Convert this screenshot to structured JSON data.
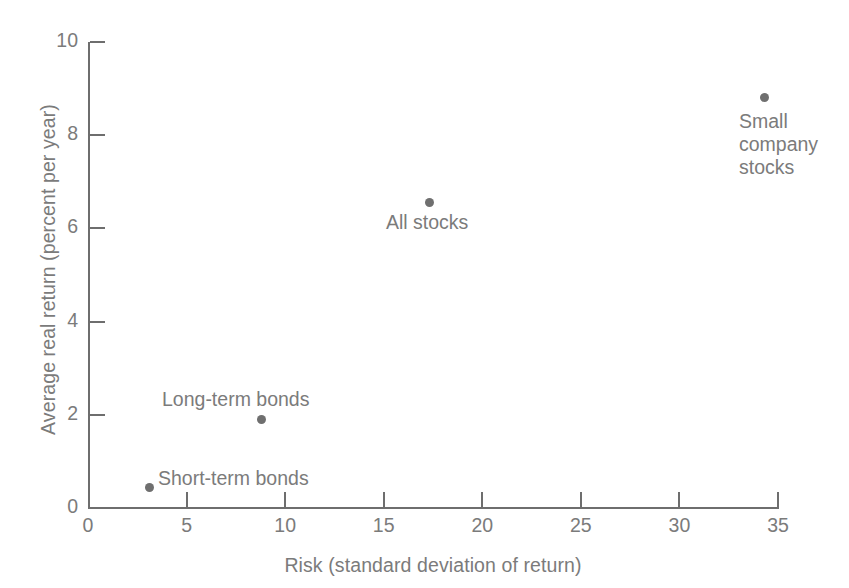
{
  "chart_data": {
    "type": "scatter",
    "title": "",
    "xlabel": "Risk (standard deviation of return)",
    "ylabel": "Average real return (percent per year)",
    "xlim": [
      0,
      35
    ],
    "ylim": [
      0,
      10
    ],
    "xticks": [
      "0",
      "5",
      "10",
      "15",
      "20",
      "25",
      "30",
      "35"
    ],
    "yticks": [
      "0",
      "2",
      "4",
      "6",
      "8",
      "10"
    ],
    "xtick_values": [
      0,
      5,
      10,
      15,
      20,
      25,
      30,
      35
    ],
    "ytick_values": [
      0,
      2,
      4,
      6,
      8,
      10
    ],
    "grid": false,
    "legend": "none",
    "marker_color": "#6f6f6f",
    "axis_color": "#6e6e6e",
    "text_color": "#7b7b7b",
    "background": "#ffffff",
    "points": [
      {
        "label": "Short-term bonds",
        "x": 3.1,
        "y": 0.45
      },
      {
        "label": "Long-term bonds",
        "x": 8.8,
        "y": 1.9
      },
      {
        "label": "All stocks",
        "x": 17.3,
        "y": 6.55
      },
      {
        "label": "Small company\nstocks",
        "x": 34.3,
        "y": 8.8
      }
    ],
    "point_labels": {
      "short_term": "Short-term bonds",
      "long_term": "Long-term bonds",
      "all_stocks": "All stocks",
      "small_company": "Small\ncompany\nstocks"
    }
  }
}
